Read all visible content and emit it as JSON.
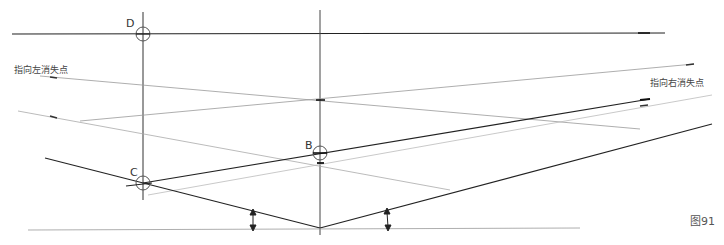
{
  "labels": {
    "left_vp": "指向左消失点",
    "right_vp": "指向右消失点",
    "point_d": "D",
    "point_c": "C",
    "point_b": "B",
    "figure": "图91"
  },
  "colors": {
    "line_dark": "#222222",
    "line_light": "#aaaaaa",
    "line_mid": "#777777",
    "text": "#444444"
  },
  "points": {
    "D": {
      "x": 143,
      "y": 34
    },
    "C": {
      "x": 143,
      "y": 183
    },
    "B": {
      "x": 320,
      "y": 153
    },
    "bottom_vertex": {
      "x": 320,
      "y": 228
    },
    "center_cross": {
      "x": 320,
      "y": 100
    }
  }
}
